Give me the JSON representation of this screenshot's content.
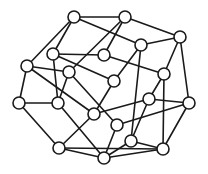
{
  "diagram": {
    "type": "undirected-graph",
    "node_radius": 6,
    "colors": {
      "stroke": "#1a1a1a",
      "node_fill": "#ffffff",
      "background": "#ffffff"
    },
    "nodes": [
      {
        "id": "A",
        "x": 74,
        "y": 17
      },
      {
        "id": "B",
        "x": 125,
        "y": 17
      },
      {
        "id": "C",
        "x": 180,
        "y": 37
      },
      {
        "id": "D",
        "x": 53,
        "y": 54
      },
      {
        "id": "E",
        "x": 141,
        "y": 45
      },
      {
        "id": "F",
        "x": 104,
        "y": 55
      },
      {
        "id": "G",
        "x": 27,
        "y": 66
      },
      {
        "id": "H",
        "x": 69,
        "y": 72
      },
      {
        "id": "I",
        "x": 164,
        "y": 74
      },
      {
        "id": "J",
        "x": 114,
        "y": 81
      },
      {
        "id": "K",
        "x": 19,
        "y": 103
      },
      {
        "id": "L",
        "x": 58,
        "y": 103
      },
      {
        "id": "M",
        "x": 149,
        "y": 99
      },
      {
        "id": "N",
        "x": 189,
        "y": 103
      },
      {
        "id": "O",
        "x": 94,
        "y": 114
      },
      {
        "id": "P",
        "x": 117,
        "y": 125
      },
      {
        "id": "Q",
        "x": 131,
        "y": 141
      },
      {
        "id": "R",
        "x": 163,
        "y": 149
      },
      {
        "id": "S",
        "x": 59,
        "y": 148
      },
      {
        "id": "T",
        "x": 104,
        "y": 158
      }
    ],
    "edges": [
      [
        "A",
        "B"
      ],
      [
        "A",
        "G"
      ],
      [
        "A",
        "D"
      ],
      [
        "A",
        "E"
      ],
      [
        "B",
        "C"
      ],
      [
        "B",
        "F"
      ],
      [
        "B",
        "H"
      ],
      [
        "C",
        "E"
      ],
      [
        "C",
        "I"
      ],
      [
        "C",
        "N"
      ],
      [
        "D",
        "F"
      ],
      [
        "D",
        "L"
      ],
      [
        "D",
        "J"
      ],
      [
        "E",
        "J"
      ],
      [
        "E",
        "Q"
      ],
      [
        "F",
        "I"
      ],
      [
        "G",
        "H"
      ],
      [
        "G",
        "K"
      ],
      [
        "G",
        "O"
      ],
      [
        "H",
        "L"
      ],
      [
        "H",
        "P"
      ],
      [
        "I",
        "M"
      ],
      [
        "I",
        "R"
      ],
      [
        "J",
        "O"
      ],
      [
        "K",
        "L"
      ],
      [
        "K",
        "S"
      ],
      [
        "L",
        "T"
      ],
      [
        "M",
        "N"
      ],
      [
        "M",
        "O"
      ],
      [
        "M",
        "Q"
      ],
      [
        "N",
        "R"
      ],
      [
        "N",
        "P"
      ],
      [
        "O",
        "S"
      ],
      [
        "P",
        "T"
      ],
      [
        "Q",
        "R"
      ],
      [
        "Q",
        "T"
      ],
      [
        "R",
        "S"
      ],
      [
        "R",
        "T"
      ],
      [
        "S",
        "T"
      ]
    ]
  }
}
